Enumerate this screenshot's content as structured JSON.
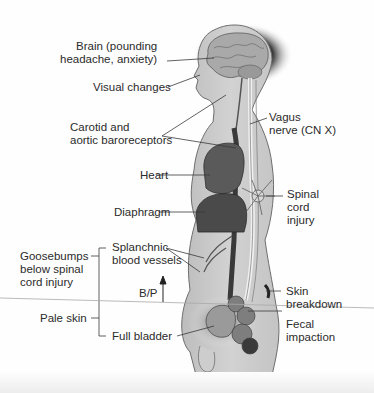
{
  "diagram": {
    "labels": {
      "brain": [
        "Brain (pounding",
        "headache, anxiety)"
      ],
      "visual": "Visual changes",
      "baroreceptors": [
        "Carotid and",
        "aortic baroreceptors"
      ],
      "vagus": [
        "Vagus",
        "nerve (CN X)"
      ],
      "heart": "Heart",
      "diaphragm": "Diaphragm",
      "spinal": [
        "Spinal",
        "cord",
        "injury"
      ],
      "goosebumps": [
        "Goosebumps",
        "below spinal",
        "cord injury"
      ],
      "splanchnic": [
        "Splanchnic",
        "blood vessels"
      ],
      "bp": "B/P",
      "pale_skin": "Pale skin",
      "full_bladder": "Full bladder",
      "skin_breakdown": [
        "Skin",
        "breakdown"
      ],
      "fecal": [
        "Fecal",
        "impaction"
      ]
    },
    "colors": {
      "body_fill": "#c9c9c9",
      "body_outline": "#6e6e6e",
      "organ_dark": "#4a4a4a",
      "brain": "#a9a9a9",
      "leader_line": "#3a3a3a",
      "text": "#2b2b2b"
    }
  }
}
